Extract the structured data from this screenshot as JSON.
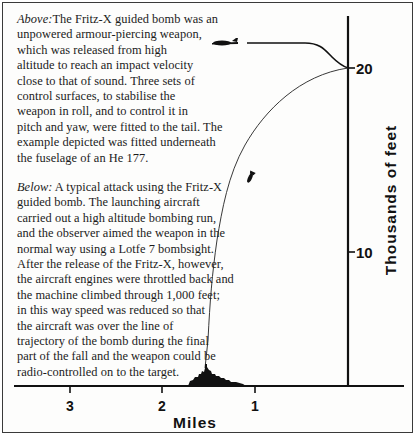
{
  "caption_above": {
    "lead": "Above:",
    "lines": [
      "The Fritz-X guided bomb was an",
      "unpowered armour-piercing weapon,",
      "which was released from high",
      "altitude to reach an impact velocity",
      "close to that of sound. Three sets of",
      "control surfaces, to stabilise the",
      "weapon in roll, and to control it in",
      "pitch and yaw, were fitted to the tail. The",
      "example depicted was fitted underneath",
      "the fuselage of an He 177."
    ]
  },
  "caption_below": {
    "lead": "Below:",
    "lines": [
      " A typical attack using the Fritz-X",
      "guided bomb. The launching aircraft",
      "carried out a high altitude bombing run,",
      "and the observer aimed the weapon in the",
      "normal way using a Lotfe 7 bombsight.",
      "After the release of the Fritz-X, however,",
      "the aircraft engines were throttled back and",
      "the machine climbed through 1,000 feet;",
      "in this way speed was reduced so that",
      "the aircraft was over the line of",
      "trajectory of the bomb during the final",
      "part of the fall and the weapon could be",
      "radio-controlled on to the target."
    ]
  },
  "diagram": {
    "y_axis": {
      "label": "Thousands of feet",
      "ticks": [
        {
          "value": "20",
          "y": 68
        },
        {
          "value": "10",
          "y": 252
        }
      ]
    },
    "x_axis": {
      "label": "Miles",
      "ticks": [
        {
          "value": "3",
          "x": 70
        },
        {
          "value": "2",
          "x": 162
        },
        {
          "value": "1",
          "x": 255
        }
      ]
    },
    "elements": {
      "aircraft": "He 177 bomber silhouette",
      "bomb": "Fritz-X guided bomb",
      "target": "ship silhouette"
    },
    "colors": {
      "ink": "#111111",
      "paper": "#fdfdfc"
    }
  }
}
